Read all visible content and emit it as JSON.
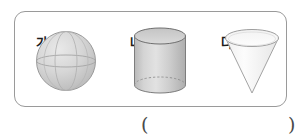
{
  "figure": {
    "caption_box": {
      "name": "solids-box",
      "border_color": "#9a9a9a",
      "background": "#ffffff"
    },
    "solids": [
      {
        "label": "가",
        "shape": "sphere",
        "icon": "sphere-icon",
        "fill": "#cfcfcf",
        "stroke": "#8e8e8e"
      },
      {
        "label": "나",
        "shape": "cylinder",
        "icon": "cylinder-icon",
        "fill": "#d2d2d2",
        "stroke": "#7d7d7d"
      },
      {
        "label": "다",
        "shape": "cone",
        "icon": "cone-icon",
        "fill": "#fbfbfb",
        "stroke": "#9e9e9e"
      }
    ]
  },
  "answer": {
    "open_paren": "(",
    "close_paren": ")",
    "value": ""
  }
}
